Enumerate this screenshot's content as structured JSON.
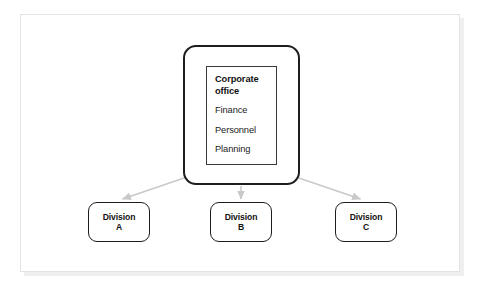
{
  "figure": {
    "type": "organizational-chart",
    "orientation": "top-down"
  },
  "corporate_office": {
    "title": "Corporate office",
    "title_line_1": "Corporate",
    "title_line_2": "office",
    "functions": [
      "Finance",
      "Personnel",
      "Planning"
    ]
  },
  "divisions": [
    {
      "name_line_1": "Division",
      "name_line_2": "A",
      "full_name": "Division A"
    },
    {
      "name_line_1": "Division",
      "name_line_2": "B",
      "full_name": "Division B"
    },
    {
      "name_line_1": "Division",
      "name_line_2": "C",
      "full_name": "Division C"
    }
  ],
  "connectors": [
    {
      "from": "corporate-office",
      "to": "division-a",
      "style": "arrow",
      "direction": "down-left"
    },
    {
      "from": "corporate-office",
      "to": "division-b",
      "style": "arrow",
      "direction": "down"
    },
    {
      "from": "corporate-office",
      "to": "division-c",
      "style": "arrow",
      "direction": "down-right"
    }
  ],
  "colors": {
    "box_border": "#1d1d1d",
    "inner_border": "#3a3a3a",
    "arrow": "#c9c9c9",
    "text": "#111111",
    "frame_border": "#e3e3e3",
    "frame_shadow": "#efefef",
    "background": "#ffffff"
  }
}
